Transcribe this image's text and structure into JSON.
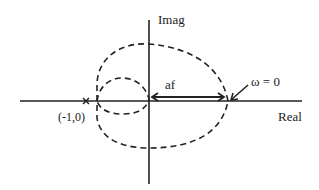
{
  "diagram": {
    "axes": {
      "vertical_label": "Imag",
      "horizontal_label": "Real"
    },
    "critical_point": {
      "marker": "x",
      "label": "(-1,0)"
    },
    "distance_label": "af",
    "omega_label": "ω = 0",
    "colors": {
      "stroke": "#222222",
      "background": "#ffffff"
    }
  }
}
